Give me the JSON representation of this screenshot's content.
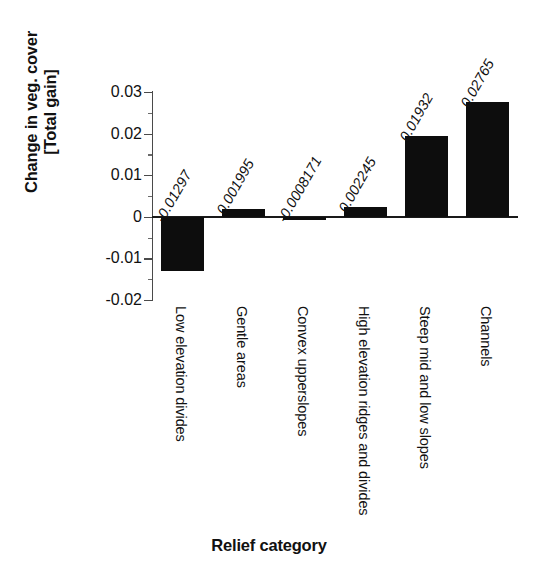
{
  "chart_data": {
    "type": "bar",
    "title": "",
    "xlabel": "Relief category",
    "ylabel_lines": [
      "Change in veg. cover",
      "[Total gain]"
    ],
    "ylabel": "Change in veg. cover [Total gain]",
    "categories": [
      "Low elevation divides",
      "Gentle areas",
      "Convex upperslopes",
      "High elevation ridges and divides",
      "Steep mid and low slopes",
      "Channels"
    ],
    "values": [
      -0.01297,
      0.001995,
      -0.0008171,
      0.002245,
      0.01932,
      0.02765
    ],
    "value_labels": [
      "-0.01297",
      "0.001995",
      "-0.0008171",
      "0.002245",
      "0.01932",
      "0.02765"
    ],
    "ylim": [
      -0.02,
      0.03
    ],
    "ytick_values": [
      0.03,
      0.02,
      0.01,
      0,
      -0.01,
      -0.02
    ],
    "ytick_labels": [
      "0.03",
      "0.02",
      "0.01",
      "0",
      "-0.01",
      "-0.02"
    ],
    "yminor_ticks": [
      0.025,
      0.015,
      0.005,
      -0.005,
      -0.015
    ],
    "grid": false,
    "legend": false,
    "bar_color": "#0d0d0d",
    "axis_color": "#4a4a4a",
    "background": "#ffffff"
  }
}
